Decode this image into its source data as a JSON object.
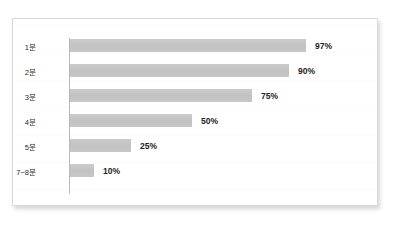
{
  "figure": {
    "background_color": "#ffffff",
    "frame_color": "#d9d9d9",
    "bar_color": "#c6c6c6",
    "axis_color": "#b9b9b9",
    "label_color": "#2b2b2b",
    "value_color": "#222222"
  },
  "chart_data": {
    "type": "bar",
    "orientation": "horizontal",
    "title": "",
    "subtitle": "",
    "xlabel": "",
    "ylabel": "",
    "categories": [
      "1분",
      "2분",
      "3분",
      "4분",
      "5분",
      "7~8분"
    ],
    "values": [
      97,
      90,
      75,
      50,
      25,
      10
    ],
    "value_labels": [
      "97%",
      "90%",
      "75%",
      "50%",
      "25%",
      "10%"
    ],
    "xlim": [
      0,
      100
    ],
    "grid": false,
    "legend": null,
    "legend_position": "none",
    "bars": [
      {
        "category": "1분",
        "value": 97,
        "label": "97%"
      },
      {
        "category": "2분",
        "value": 90,
        "label": "90%"
      },
      {
        "category": "3분",
        "value": 75,
        "label": "75%"
      },
      {
        "category": "4분",
        "value": 50,
        "label": "50%"
      },
      {
        "category": "5분",
        "value": 25,
        "label": "25%"
      },
      {
        "category": "7~8분",
        "value": 10,
        "label": "10%"
      }
    ]
  }
}
